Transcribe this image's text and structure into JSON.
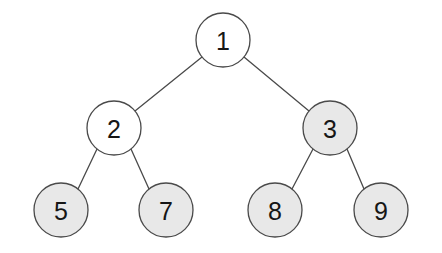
{
  "diagram": {
    "type": "binary-tree",
    "background_color": "#ffffff",
    "stroke_color": "#4a4a4a",
    "label_color": "#161616",
    "fill_plain": "#ffffff",
    "fill_shaded": "#e8e8e8",
    "node_radius": 27,
    "stroke_width": 1.3,
    "canvas": {
      "width": 442,
      "height": 253
    },
    "nodes": [
      {
        "id": "n1",
        "label": "1",
        "cx": 223,
        "cy": 40,
        "fill": "plain",
        "level": 0,
        "role": "root"
      },
      {
        "id": "n2",
        "label": "2",
        "cx": 114,
        "cy": 128,
        "fill": "plain",
        "level": 1,
        "role": "internal"
      },
      {
        "id": "n3",
        "label": "3",
        "cx": 330,
        "cy": 128,
        "fill": "shaded",
        "level": 1,
        "role": "internal"
      },
      {
        "id": "n5",
        "label": "5",
        "cx": 61,
        "cy": 210,
        "fill": "shaded",
        "level": 2,
        "role": "leaf"
      },
      {
        "id": "n7",
        "label": "7",
        "cx": 166,
        "cy": 210,
        "fill": "shaded",
        "level": 2,
        "role": "leaf"
      },
      {
        "id": "n8",
        "label": "8",
        "cx": 275,
        "cy": 210,
        "fill": "shaded",
        "level": 2,
        "role": "leaf"
      },
      {
        "id": "n9",
        "label": "9",
        "cx": 381,
        "cy": 210,
        "fill": "shaded",
        "level": 2,
        "role": "leaf"
      }
    ],
    "edges": [
      {
        "id": "e1",
        "from": "n1",
        "to": "n2",
        "x1": 202,
        "y1": 57,
        "x2": 135,
        "y2": 111
      },
      {
        "id": "e2",
        "from": "n1",
        "to": "n3",
        "x1": 244,
        "y1": 57,
        "x2": 309,
        "y2": 111
      },
      {
        "id": "e3",
        "from": "n2",
        "to": "n5",
        "x1": 97,
        "y1": 149,
        "x2": 78,
        "y2": 189
      },
      {
        "id": "e4",
        "from": "n2",
        "to": "n7",
        "x1": 131,
        "y1": 149,
        "x2": 149,
        "y2": 189
      },
      {
        "id": "e5",
        "from": "n3",
        "to": "n8",
        "x1": 313,
        "y1": 149,
        "x2": 292,
        "y2": 189
      },
      {
        "id": "e6",
        "from": "n3",
        "to": "n9",
        "x1": 347,
        "y1": 149,
        "x2": 364,
        "y2": 189
      }
    ]
  }
}
